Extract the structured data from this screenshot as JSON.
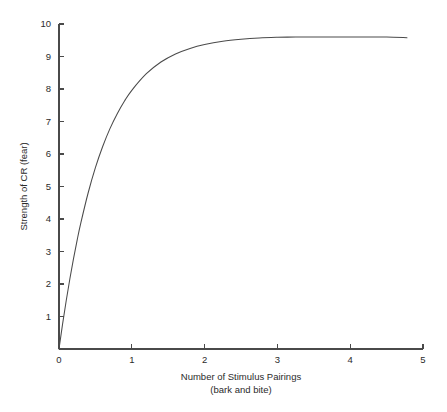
{
  "chart_data": {
    "type": "line",
    "title": "",
    "xlabel": "Number of Stimulus Pairings",
    "xlabel_line2": "(bark and bite)",
    "ylabel": "Strength of CR (fear)",
    "xlim": [
      0,
      5
    ],
    "ylim": [
      0,
      10
    ],
    "xticks": [
      0,
      1,
      2,
      3,
      4,
      5
    ],
    "xtick_labels": [
      "0",
      "1",
      "2",
      "3",
      "4",
      "5"
    ],
    "yticks": [
      1,
      2,
      3,
      4,
      5,
      6,
      7,
      8,
      9,
      10
    ],
    "ytick_labels": [
      "1",
      "2",
      "3",
      "4",
      "5",
      "6",
      "7",
      "8",
      "9",
      "10"
    ],
    "grid": false,
    "legend": false,
    "legend_position": "none",
    "asymptote": 9.6,
    "series": [
      {
        "name": "Acquisition curve",
        "color": "#4a4a4a",
        "x": [
          0.0,
          0.05,
          0.1,
          0.15,
          0.2,
          0.25,
          0.3,
          0.4,
          0.5,
          0.6,
          0.7,
          0.8,
          0.9,
          1.0,
          1.2,
          1.4,
          1.6,
          1.8,
          2.0,
          2.25,
          2.5,
          2.75,
          3.0,
          3.25,
          3.5,
          3.75,
          4.0,
          4.25,
          4.5,
          4.78
        ],
        "y": [
          0.0,
          0.78,
          1.5,
          2.17,
          2.79,
          3.36,
          3.88,
          4.8,
          5.58,
          6.23,
          6.78,
          7.24,
          7.63,
          7.96,
          8.47,
          8.83,
          9.08,
          9.25,
          9.37,
          9.47,
          9.53,
          9.57,
          9.59,
          9.6,
          9.6,
          9.6,
          9.6,
          9.6,
          9.6,
          9.58
        ]
      }
    ]
  },
  "geometry": {
    "origin_x_px": 59,
    "origin_y_px": 349,
    "x_unit_px": 72.8,
    "y_unit_px": 32.5
  },
  "axis_labels": {
    "y_axis_title": "Strength of CR (fear)",
    "x_axis_title_line1": "Number of Stimulus Pairings",
    "x_axis_title_line2": "(bark and bite)"
  },
  "colors": {
    "background": "#ffffff",
    "axis": "#4a4a4a",
    "curve": "#4a4a4a",
    "text": "#2b2b2b"
  }
}
